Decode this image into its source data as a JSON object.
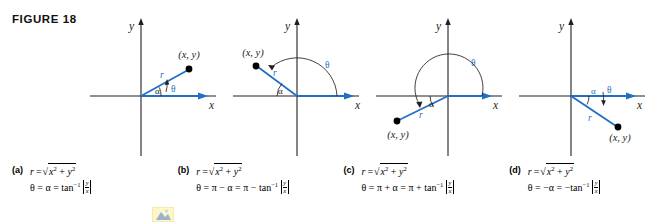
{
  "figure": {
    "label": "FIGURE 18"
  },
  "colors": {
    "accent_blue": "#1f6fc4",
    "axis_black": "#231f20",
    "point_black": "#000000",
    "text_black": "#000000"
  },
  "panels": [
    {
      "id": "panel-a",
      "quadrant": "I",
      "axis_x_label": "x",
      "axis_y_label": "y",
      "point_label": "(x, y)",
      "r_label": "r",
      "theta_label": "θ",
      "alpha_label": "α",
      "arc_description": "small angle theta from positive x-axis to ray"
    },
    {
      "id": "panel-b",
      "quadrant": "II",
      "axis_x_label": "x",
      "axis_y_label": "y",
      "point_label": "(x, y)",
      "r_label": "r",
      "theta_label": "θ",
      "alpha_label": "α",
      "arc_description": "obtuse angle theta from positive x-axis counterclockwise to ray"
    },
    {
      "id": "panel-c",
      "quadrant": "III",
      "axis_x_label": "x",
      "axis_y_label": "y",
      "point_label": "(x, y)",
      "r_label": "r",
      "theta_label": "θ",
      "alpha_label": "α",
      "arc_description": "reflex-approaching angle theta counterclockwise past pi to ray"
    },
    {
      "id": "panel-d",
      "quadrant": "IV",
      "axis_x_label": "x",
      "axis_y_label": "y",
      "point_label": "(x, y)",
      "r_label": "r",
      "theta_label": "θ",
      "alpha_label": "α",
      "arc_description": "negative angle theta clockwise from positive x-axis to ray"
    }
  ],
  "captions": [
    {
      "tag": "(a)",
      "r_equation": "r = √(x² + y²)",
      "theta_equation": "θ = α = tan⁻¹ |y/x|",
      "theta_lhs": "θ = α = ",
      "theta_fn": "tan",
      "theta_exp": "−1",
      "theta_sign": ""
    },
    {
      "tag": "(b)",
      "r_equation": "r = √(x² + y²)",
      "theta_equation": "θ = π − α = π − tan⁻¹ |y/x|",
      "theta_lhs": "θ = π − α = π − ",
      "theta_fn": "tan",
      "theta_exp": "−1",
      "theta_sign": ""
    },
    {
      "tag": "(c)",
      "r_equation": "r = √(x² + y²)",
      "theta_equation": "θ = π + α = π + tan⁻¹ |y/x|",
      "theta_lhs": "θ = π + α = π + ",
      "theta_fn": "tan",
      "theta_exp": "−1",
      "theta_sign": ""
    },
    {
      "tag": "(d)",
      "r_equation": "r = √(x² + y²)",
      "theta_equation": "θ = −α = −tan⁻¹ |y/x|",
      "theta_lhs": "θ = −α = −",
      "theta_fn": "tan",
      "theta_exp": "−1",
      "theta_sign": ""
    }
  ],
  "math_tokens": {
    "r": "r",
    "equals": "=",
    "x": "x",
    "y": "y",
    "two": "2",
    "plus": "+",
    "frac_num": "y",
    "frac_den": "x"
  }
}
